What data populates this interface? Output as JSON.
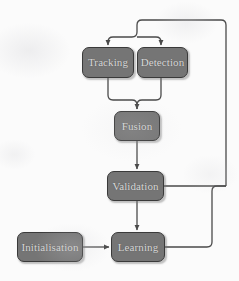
{
  "diagram": {
    "background_color": "#fbfbfb",
    "node_fill_color": "#757575",
    "node_border_color": "#3a3a3a",
    "node_text_color": "#d8d8d8",
    "edge_color": "#4a4a4a",
    "nodes": [
      {
        "id": "tracking",
        "label": "Tracking",
        "x": 82,
        "y": 47,
        "w": 52,
        "h": 31
      },
      {
        "id": "detection",
        "label": "Detection",
        "x": 137,
        "y": 47,
        "w": 51,
        "h": 31
      },
      {
        "id": "fusion",
        "label": "Fusion",
        "x": 114,
        "y": 111,
        "w": 46,
        "h": 30
      },
      {
        "id": "validation",
        "label": "Validation",
        "x": 107,
        "y": 171,
        "w": 57,
        "h": 30
      },
      {
        "id": "learning",
        "label": "Learning",
        "x": 111,
        "y": 232,
        "w": 54,
        "h": 30
      },
      {
        "id": "initialisation",
        "label": "Initialisation",
        "x": 17,
        "y": 232,
        "w": 66,
        "h": 30
      }
    ],
    "edges": [
      {
        "id": "feedback-to-trackers",
        "from": "top-loop",
        "to": "tracking, detection",
        "arrow": true
      },
      {
        "id": "tracking-to-fusion",
        "from": "tracking",
        "to": "fusion",
        "arrow": true
      },
      {
        "id": "detection-to-fusion",
        "from": "detection",
        "to": "fusion",
        "arrow": true
      },
      {
        "id": "fusion-to-validation",
        "from": "fusion",
        "to": "validation",
        "arrow": true
      },
      {
        "id": "validation-to-learning",
        "from": "validation",
        "to": "learning",
        "arrow": true
      },
      {
        "id": "initialisation-to-learning",
        "from": "initialisation",
        "to": "learning",
        "arrow": true
      },
      {
        "id": "validation-feedback",
        "from": "validation",
        "to": "top-loop",
        "arrow": false
      },
      {
        "id": "learning-feedback",
        "from": "learning",
        "to": "validation-feedback",
        "arrow": false
      }
    ]
  }
}
